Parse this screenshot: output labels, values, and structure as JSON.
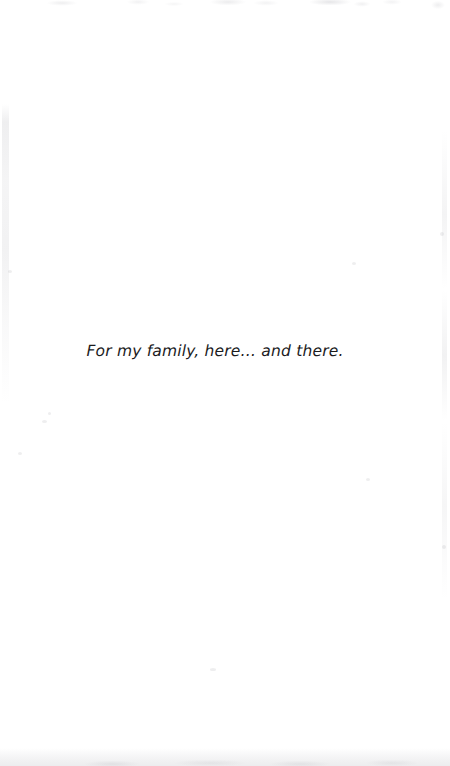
{
  "page": {
    "kind": "book-dedication-page",
    "background_color": "#ffffff",
    "text_color": "#1b1b1d"
  },
  "dedication": {
    "text": "For my family, here… and there."
  },
  "artifacts": {
    "top_edge_label": "scan-noise-top-edge",
    "left_edge_label": "scan-streak-left-edge",
    "right_edge_label": "scan-speckle-right-edge",
    "bottom_edge_label": "scan-shadow-bottom-edge"
  }
}
